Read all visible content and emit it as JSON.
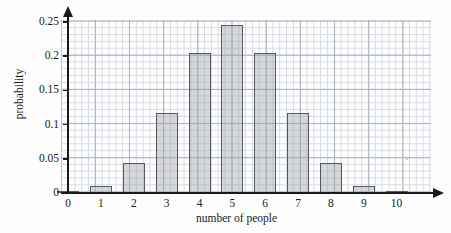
{
  "chart_data": {
    "type": "bar",
    "title": "",
    "xlabel": "number of people",
    "ylabel": "probability",
    "categories": [
      "0",
      "1",
      "2",
      "3",
      "4",
      "5",
      "6",
      "7",
      "8",
      "9",
      "10"
    ],
    "values": [
      0.001,
      0.0098,
      0.044,
      0.117,
      0.205,
      0.246,
      0.205,
      0.117,
      0.044,
      0.0098,
      0.001
    ],
    "xlim": [
      0,
      10
    ],
    "ylim": [
      0,
      0.25
    ],
    "ytick_labels": [
      "0",
      "0.05",
      "0.1",
      "0.15",
      "0.2",
      "0.25"
    ],
    "ytick_values": [
      0,
      0.05,
      0.1,
      0.15,
      0.2,
      0.25
    ],
    "xtick_labels": [
      "0",
      "1",
      "2",
      "3",
      "4",
      "5",
      "6",
      "7",
      "8",
      "9",
      "10"
    ],
    "grid": true,
    "legend": "none",
    "bar_fill_color": "#9b9ea0",
    "bar_edge_color": "#55585c",
    "grid_major_color": "#9aa4b0",
    "grid_minor_color": "#cfd6de",
    "axis_color": "#1a1a1a"
  }
}
